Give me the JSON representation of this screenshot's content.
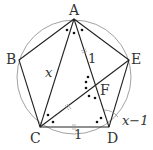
{
  "diagram": {
    "type": "geometry",
    "points": {
      "A": {
        "label": "A",
        "x": 74,
        "y": 19
      },
      "B": {
        "label": "B",
        "x": 19,
        "y": 60
      },
      "C": {
        "label": "C",
        "x": 40,
        "y": 127
      },
      "D": {
        "label": "D",
        "x": 109,
        "y": 127
      },
      "E": {
        "label": "E",
        "x": 129,
        "y": 60
      },
      "F": {
        "label": "F",
        "x": 96,
        "y": 86
      }
    },
    "circle": {
      "cx": 74,
      "cy": 77,
      "r": 57
    },
    "segment_labels": {
      "AC": "x",
      "AF": "1",
      "CD": "1",
      "FD": "x−1"
    },
    "colors": {
      "lines": "#222222",
      "circle": "#888888",
      "text": "#333333"
    }
  }
}
